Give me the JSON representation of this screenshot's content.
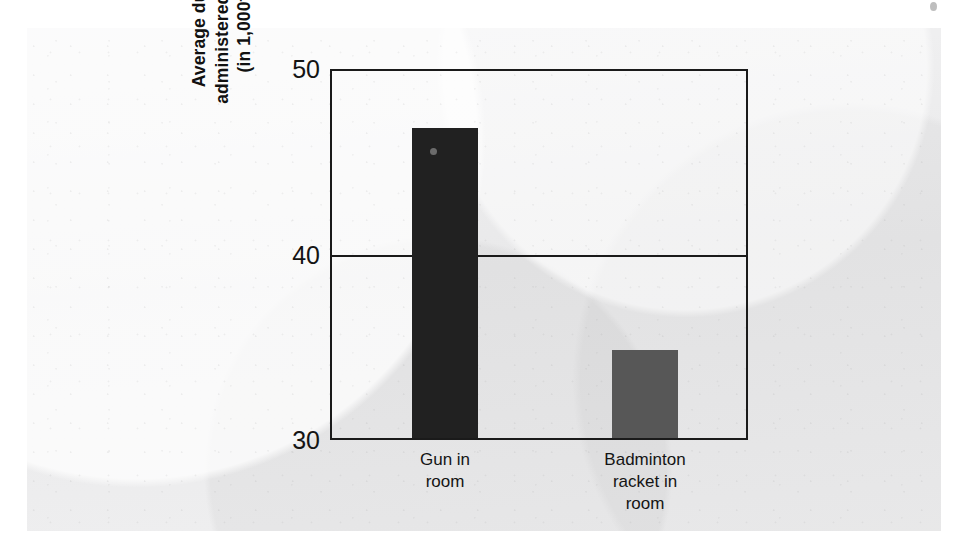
{
  "chart_data": {
    "type": "bar",
    "title": "",
    "xlabel": "",
    "ylabel": "Average duration of shocks administered by angry subjects (in 1,000ths of a minute)",
    "ylabel_lines": [
      "Average duration of shocks",
      "administered by angry subjects",
      "(in 1,000ths of a minute)"
    ],
    "categories": [
      "Gun in room",
      "Badminton racket in room"
    ],
    "category_lines": [
      [
        "Gun in",
        "room"
      ],
      [
        "Badminton",
        "racket in",
        "room"
      ]
    ],
    "values": [
      46.9,
      34.8
    ],
    "ylim": [
      30,
      50
    ],
    "yticks": [
      30,
      40,
      50
    ],
    "ytick_labels": [
      "30",
      "40",
      "50"
    ],
    "gridlines": [
      40
    ],
    "grid": true,
    "legend": "none",
    "bar_colors": [
      "#212121",
      "#575757"
    ],
    "frame_color": "#1a1a1a",
    "background_color": "#ececed"
  }
}
